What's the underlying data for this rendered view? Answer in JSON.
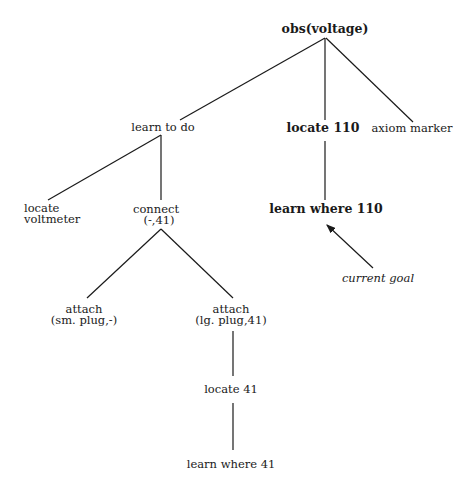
{
  "diagram": {
    "type": "goal-tree",
    "nodes": {
      "root": {
        "label": "obs(voltage)",
        "bold": true
      },
      "learn_to_do": {
        "label": "learn to do"
      },
      "locate_110": {
        "label": "locate 110",
        "bold": true
      },
      "axiom_marker": {
        "label": "axiom marker"
      },
      "locate_voltmeter": {
        "line1": "locate",
        "line2": "voltmeter"
      },
      "connect": {
        "line1": "connect",
        "line2": "(-,41)"
      },
      "learn_where_110": {
        "label": "learn where 110",
        "bold": true
      },
      "attach_sm": {
        "line1": "attach",
        "line2": "(sm. plug,-)"
      },
      "attach_lg": {
        "line1": "attach",
        "line2": "(lg. plug,41)"
      },
      "locate_41": {
        "label": "locate 41"
      },
      "learn_where_41": {
        "label": "learn where 41"
      }
    },
    "edges": [
      [
        "root",
        "learn_to_do"
      ],
      [
        "root",
        "locate_110"
      ],
      [
        "root",
        "axiom_marker"
      ],
      [
        "learn_to_do",
        "locate_voltmeter"
      ],
      [
        "learn_to_do",
        "connect"
      ],
      [
        "locate_110",
        "learn_where_110"
      ],
      [
        "connect",
        "attach_sm"
      ],
      [
        "connect",
        "attach_lg"
      ],
      [
        "attach_lg",
        "locate_41"
      ],
      [
        "locate_41",
        "learn_where_41"
      ]
    ],
    "annotation": {
      "label": "current goal",
      "italic": true,
      "points_to": "learn_where_110"
    },
    "line_color": "#1a1a1a",
    "background": "#ffffff"
  }
}
